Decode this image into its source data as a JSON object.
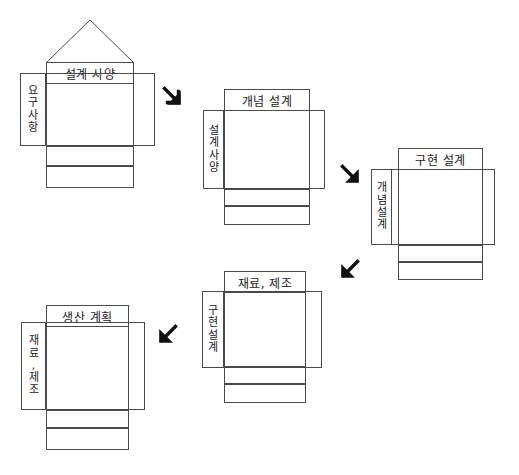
{
  "diagram": {
    "type": "qfd-cascade",
    "stages": [
      {
        "id": "stage-1",
        "title": "설계 사양",
        "input_label": "요구사항",
        "input_chars": [
          "요",
          "구",
          "사",
          "항"
        ],
        "has_roof": true
      },
      {
        "id": "stage-2",
        "title": "개념 설계",
        "input_label": "설계 사양",
        "input_chars": [
          "설",
          "계",
          "사",
          "양"
        ],
        "has_roof": false
      },
      {
        "id": "stage-3",
        "title": "구현 설계",
        "input_label": "개념 설계",
        "input_chars": [
          "개",
          "념",
          "설",
          "계"
        ],
        "has_roof": false
      },
      {
        "id": "stage-4",
        "title": "재료, 제조",
        "input_label": "구현 설계",
        "input_chars": [
          "구",
          "현",
          "설",
          "계"
        ],
        "has_roof": false
      },
      {
        "id": "stage-5",
        "title": "생산 계획",
        "input_label": "재료, 제조",
        "input_chars": [
          "재",
          "료",
          ",",
          "제",
          "조"
        ],
        "has_roof": false
      }
    ],
    "arrows": [
      {
        "id": "arrow-1",
        "direction": "down-right",
        "glyph": "↘"
      },
      {
        "id": "arrow-2",
        "direction": "down-right",
        "glyph": "↘"
      },
      {
        "id": "arrow-3",
        "direction": "down-left",
        "glyph": "↙"
      },
      {
        "id": "arrow-4",
        "direction": "down-left",
        "glyph": "↙"
      }
    ],
    "colors": {
      "background": "#ffffff",
      "stroke": "#4a4a4a",
      "text": "#1a1a1a",
      "arrow": "#111111"
    }
  }
}
